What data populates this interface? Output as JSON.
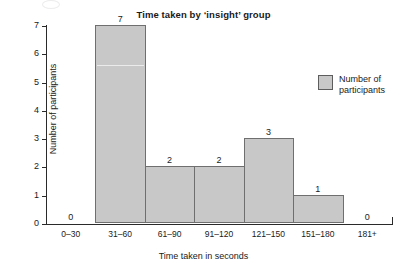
{
  "chart_data": {
    "type": "bar",
    "title": "Time taken by ‘insight’ group",
    "xlabel": "Time taken in seconds",
    "ylabel": "Number of participants",
    "categories": [
      "0–30",
      "31–60",
      "61–90",
      "91–120",
      "121–150",
      "151–180",
      "181+"
    ],
    "values": [
      0,
      7,
      2,
      2,
      3,
      1,
      0
    ],
    "value_labels": [
      "0",
      "7",
      "2",
      "2",
      "3",
      "1",
      "0"
    ],
    "ylim": [
      0,
      7
    ],
    "yticks": [
      "7",
      "6",
      "5",
      "4",
      "3",
      "2",
      "1",
      "0"
    ],
    "grid": false,
    "legend": {
      "position": "top-right",
      "entries": [
        {
          "label": "Number of\nparticipants",
          "color": "#c8c8c8"
        }
      ]
    },
    "colors": {
      "bar_fill": "#c8c8c8",
      "bar_edge": "#6f6f6f",
      "axis": "#2a2a2a",
      "text": "#1a1a1a",
      "background": "#ffffff"
    }
  }
}
